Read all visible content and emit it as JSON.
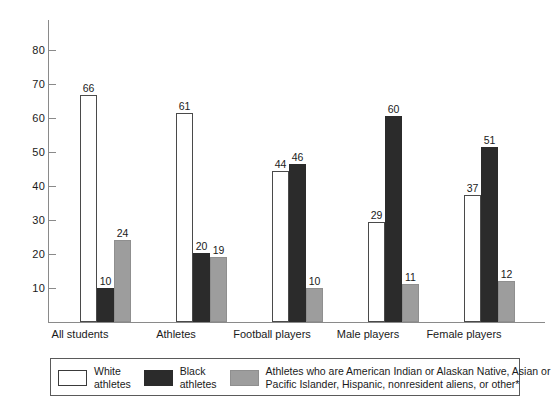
{
  "chart_data": {
    "type": "bar",
    "title": "",
    "subtitle": "",
    "xlabel": "",
    "ylabel": "",
    "ylim": [
      0,
      88
    ],
    "grid": false,
    "legend_position": "bottom",
    "categories": [
      "All students",
      "Athletes",
      "Football players",
      "Male players",
      "Female players"
    ],
    "yticks": [
      10,
      20,
      30,
      40,
      50,
      60,
      70,
      80
    ],
    "series": [
      {
        "name": "White athletes",
        "legend_line1": "White",
        "legend_line2": "athletes",
        "color": "#ffffff",
        "values": [
          66,
          61,
          44,
          29,
          37
        ]
      },
      {
        "name": "Black athletes",
        "legend_line1": "Black",
        "legend_line2": "athletes",
        "color": "#2b2b2b",
        "values": [
          10,
          20,
          46,
          60,
          51
        ]
      },
      {
        "name": "Athletes who are American Indian or Alaskan Native, Asian or Pacific Islander, Hispanic, nonresident aliens, or other*",
        "legend_line1": "Athletes who are American Indian or Alaskan Native, Asian or",
        "legend_line2": "Pacific Islander, Hispanic, nonresident aliens, or other*",
        "color": "#9d9d9d",
        "values": [
          24,
          19,
          10,
          11,
          12
        ]
      }
    ]
  },
  "footnote": {
    "text": ""
  }
}
